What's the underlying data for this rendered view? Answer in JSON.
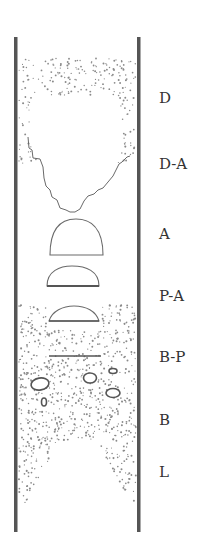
{
  "diagram": {
    "type": "fluidized-bed flow regime column",
    "colors": {
      "wall": "#555555",
      "outline": "#6a6a6a",
      "particle": "#8a8a8a",
      "label": "#333333",
      "background": "#ffffff"
    },
    "column": {
      "left_x": 15.5,
      "right_x": 138.5,
      "top_y": 37,
      "bottom_y": 532,
      "wall_width": 3.5
    },
    "regions": [
      {
        "id": "D",
        "label": "D",
        "label_y": 90,
        "description": "dense particle cloud around large void (top)"
      },
      {
        "id": "D-A",
        "label": "D-A",
        "label_y": 157,
        "description": "jagged void boundary"
      },
      {
        "id": "A",
        "label": "A",
        "label_y": 227,
        "description": "large hemispherical cap bubble"
      },
      {
        "id": "P-A",
        "label": "P-A",
        "label_y": 289,
        "description": "smaller hemispherical cap bubble"
      },
      {
        "id": "B-P",
        "label": "B-P",
        "label_y": 350,
        "description": "flat cap bubbles in particle bed"
      },
      {
        "id": "B",
        "label": "B",
        "label_y": 413,
        "description": "small bubbles dispersed in particle bed"
      },
      {
        "id": "L",
        "label": "L",
        "label_y": 465,
        "description": "particle bed with inverted-V void at bottom"
      }
    ]
  }
}
